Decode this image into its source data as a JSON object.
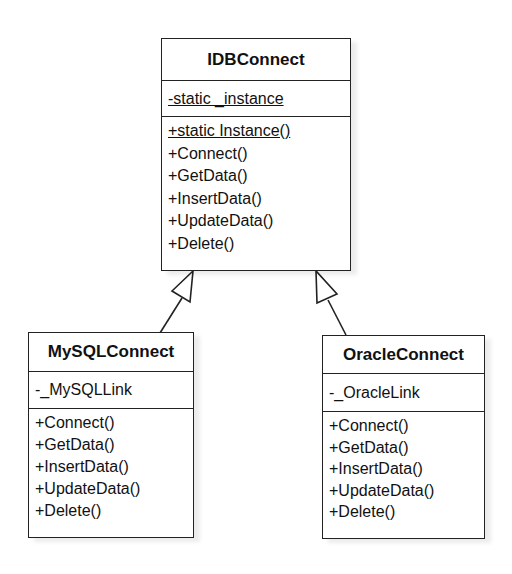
{
  "classes": {
    "base": {
      "name": "IDBConnect",
      "attributes": [
        "-static _instance"
      ],
      "operations": [
        "+static Instance()",
        "+Connect()",
        "+GetData()",
        "+InsertData()",
        "+UpdateData()",
        "+Delete()"
      ]
    },
    "mysql": {
      "name": "MySQLConnect",
      "attributes": [
        "-_MySQLLink"
      ],
      "operations": [
        "+Connect()",
        "+GetData()",
        "+InsertData()",
        "+UpdateData()",
        "+Delete()"
      ]
    },
    "oracle": {
      "name": "OracleConnect",
      "attributes": [
        "-_OracleLink"
      ],
      "operations": [
        "+Connect()",
        "+GetData()",
        "+InsertData()",
        "+UpdateData()",
        "+Delete()"
      ]
    }
  },
  "relationships": [
    {
      "type": "generalization",
      "from": "MySQLConnect",
      "to": "IDBConnect"
    },
    {
      "type": "generalization",
      "from": "OracleConnect",
      "to": "IDBConnect"
    }
  ]
}
